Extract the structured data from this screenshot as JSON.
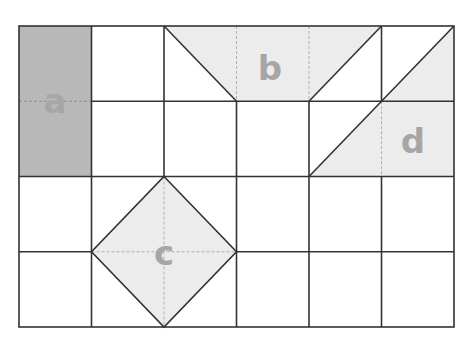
{
  "diagram": {
    "grid": {
      "cols": 6,
      "rows": 4,
      "x0": 19,
      "y0": 26,
      "cell_w": 72.5,
      "cell_h": 75.25
    },
    "colors": {
      "background": "#ffffff",
      "grid_line": "#333333",
      "dashed_line": "#b0b0b0",
      "shape_a_fill": "#b8b8b8",
      "shape_light_fill": "#ececec",
      "label_color": "#a6a6a6"
    },
    "shapes": [
      {
        "id": "a",
        "label": "a",
        "kind": "rectangle",
        "points": [
          [
            0,
            0
          ],
          [
            1,
            0
          ],
          [
            1,
            2
          ],
          [
            0,
            2
          ]
        ],
        "fill": "dark"
      },
      {
        "id": "b",
        "label": "b",
        "kind": "trapezoid",
        "points": [
          [
            2,
            0
          ],
          [
            5,
            0
          ],
          [
            4,
            1
          ],
          [
            2,
            1
          ]
        ],
        "fill": "light"
      },
      {
        "id": "c",
        "label": "c",
        "kind": "square-diamond",
        "points": [
          [
            2,
            2
          ],
          [
            3,
            3
          ],
          [
            2,
            4
          ],
          [
            1,
            3
          ]
        ],
        "fill": "light"
      },
      {
        "id": "d",
        "label": "d",
        "kind": "triangle",
        "points": [
          [
            6,
            0
          ],
          [
            6,
            2
          ],
          [
            4,
            2
          ]
        ],
        "fill": "light"
      }
    ],
    "labels": {
      "a": "a",
      "b": "b",
      "c": "c",
      "d": "d"
    }
  }
}
